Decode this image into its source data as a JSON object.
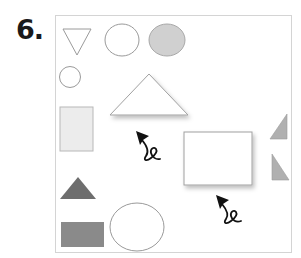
{
  "exercise": {
    "number_label": "6."
  },
  "colors": {
    "outline": "#9a9a9a",
    "light_fill": "#ececec",
    "medium_fill": "#d0d0d0",
    "right_tri_fill": "#b0b0b0",
    "dark_tri_fill": "#6e6e6e",
    "dark_rect_fill": "#8a8a8a",
    "arrow": "#111111",
    "frame_border": "#d4d4d4"
  },
  "shapes": [
    {
      "id": "inverted-triangle",
      "type": "triangle",
      "style": "outline"
    },
    {
      "id": "circle-top",
      "type": "circle",
      "style": "outline"
    },
    {
      "id": "ellipse-gray",
      "type": "ellipse",
      "style": "filled-light-gray"
    },
    {
      "id": "small-circle",
      "type": "circle",
      "style": "outline"
    },
    {
      "id": "large-triangle",
      "type": "triangle",
      "style": "outline-shadow"
    },
    {
      "id": "light-rectangle",
      "type": "rectangle",
      "style": "filled-very-light-gray"
    },
    {
      "id": "white-rectangle",
      "type": "rectangle",
      "style": "outline-shadow"
    },
    {
      "id": "right-triangle-top",
      "type": "right-triangle",
      "style": "filled-gray"
    },
    {
      "id": "right-triangle-bottom",
      "type": "right-triangle",
      "style": "filled-gray"
    },
    {
      "id": "dark-triangle",
      "type": "triangle",
      "style": "filled-dark-gray"
    },
    {
      "id": "dark-rectangle",
      "type": "rectangle",
      "style": "filled-dark-gray"
    },
    {
      "id": "large-circle",
      "type": "circle",
      "style": "outline"
    }
  ],
  "arrows": [
    {
      "id": "arrow-left",
      "icon": "curly-arrow-icon",
      "direction": "up-left"
    },
    {
      "id": "arrow-right",
      "icon": "curly-arrow-icon",
      "direction": "up-left"
    }
  ]
}
